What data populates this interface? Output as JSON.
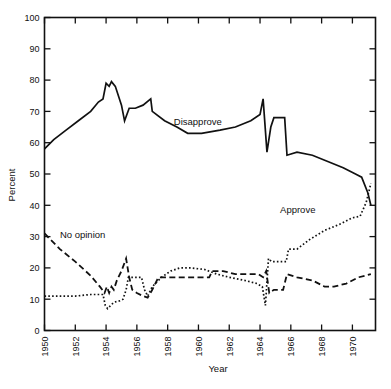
{
  "chart_data": {
    "type": "line",
    "title": "",
    "xlabel": "Year",
    "ylabel": "Percent",
    "xlim": [
      1950,
      1971.5
    ],
    "ylim": [
      0,
      100
    ],
    "grid": false,
    "legend_position": "inline-annotations",
    "x_ticks": [
      1950,
      1952,
      1954,
      1956,
      1958,
      1960,
      1962,
      1964,
      1966,
      1968,
      1970
    ],
    "x_tick_labels": [
      "1950",
      "1952",
      "1954",
      "1956",
      "1958",
      "1960",
      "1962",
      "1964",
      "1966",
      "1968",
      "1970"
    ],
    "y_ticks": [
      0,
      10,
      20,
      30,
      40,
      50,
      60,
      70,
      80,
      90,
      100
    ],
    "y_tick_labels": [
      "0",
      "10",
      "20",
      "30",
      "40",
      "50",
      "60",
      "70",
      "80",
      "90",
      "100"
    ],
    "series": [
      {
        "name": "Disapprove",
        "style": "solid",
        "label_x": 1958.4,
        "label_y": 65.5,
        "points": [
          [
            1950.0,
            58
          ],
          [
            1950.6,
            61
          ],
          [
            1951.4,
            64
          ],
          [
            1952.2,
            67
          ],
          [
            1953.0,
            70
          ],
          [
            1953.5,
            73
          ],
          [
            1953.8,
            74
          ],
          [
            1954.0,
            79
          ],
          [
            1954.2,
            78
          ],
          [
            1954.35,
            79.5
          ],
          [
            1954.6,
            78
          ],
          [
            1955.0,
            72
          ],
          [
            1955.2,
            67
          ],
          [
            1955.5,
            71
          ],
          [
            1955.9,
            71
          ],
          [
            1956.4,
            72
          ],
          [
            1956.9,
            74
          ],
          [
            1957.0,
            70
          ],
          [
            1957.8,
            67
          ],
          [
            1958.6,
            65
          ],
          [
            1959.3,
            63
          ],
          [
            1960.2,
            63
          ],
          [
            1961.4,
            64
          ],
          [
            1962.4,
            65
          ],
          [
            1963.4,
            67
          ],
          [
            1964.0,
            69
          ],
          [
            1964.2,
            74
          ],
          [
            1964.45,
            57
          ],
          [
            1964.7,
            65
          ],
          [
            1964.9,
            68
          ],
          [
            1965.6,
            68
          ],
          [
            1965.75,
            56
          ],
          [
            1966.4,
            57
          ],
          [
            1967.4,
            56
          ],
          [
            1968.4,
            54
          ],
          [
            1969.4,
            52
          ],
          [
            1970.2,
            50
          ],
          [
            1970.6,
            49
          ],
          [
            1971.0,
            44
          ],
          [
            1971.2,
            40
          ]
        ]
      },
      {
        "name": "Approve",
        "style": "dotted",
        "label_x": 1965.3,
        "label_y": 37.5,
        "points": [
          [
            1950.0,
            11
          ],
          [
            1951.0,
            11
          ],
          [
            1952.0,
            11
          ],
          [
            1953.0,
            11.5
          ],
          [
            1953.5,
            11.5
          ],
          [
            1953.8,
            11.5
          ],
          [
            1953.95,
            8
          ],
          [
            1954.1,
            7
          ],
          [
            1954.5,
            9
          ],
          [
            1954.9,
            9.5
          ],
          [
            1955.1,
            10
          ],
          [
            1955.3,
            13
          ],
          [
            1955.45,
            17
          ],
          [
            1955.9,
            17
          ],
          [
            1956.3,
            17
          ],
          [
            1956.5,
            13
          ],
          [
            1956.7,
            11
          ],
          [
            1957.0,
            14
          ],
          [
            1957.6,
            17
          ],
          [
            1958.2,
            19
          ],
          [
            1958.8,
            20
          ],
          [
            1959.5,
            20
          ],
          [
            1960.4,
            19.5
          ],
          [
            1961.2,
            18
          ],
          [
            1962.0,
            17
          ],
          [
            1963.0,
            16
          ],
          [
            1963.8,
            15
          ],
          [
            1964.15,
            14
          ],
          [
            1964.35,
            8
          ],
          [
            1964.55,
            23
          ],
          [
            1964.75,
            22
          ],
          [
            1965.2,
            22
          ],
          [
            1965.7,
            22
          ],
          [
            1965.85,
            26
          ],
          [
            1966.4,
            26
          ],
          [
            1967.2,
            29
          ],
          [
            1968.2,
            32
          ],
          [
            1969.2,
            34
          ],
          [
            1970.0,
            36
          ],
          [
            1970.5,
            36.5
          ],
          [
            1970.9,
            41
          ],
          [
            1971.2,
            47
          ]
        ]
      },
      {
        "name": "No opinion",
        "style": "dashed",
        "label_x": 1951.0,
        "label_y": 29.5,
        "points": [
          [
            1950.0,
            31
          ],
          [
            1951.0,
            26
          ],
          [
            1952.0,
            22
          ],
          [
            1953.0,
            17.5
          ],
          [
            1953.6,
            14
          ],
          [
            1953.9,
            12
          ],
          [
            1954.05,
            14
          ],
          [
            1954.2,
            12
          ],
          [
            1954.35,
            14
          ],
          [
            1954.5,
            13
          ],
          [
            1954.7,
            16
          ],
          [
            1955.0,
            19
          ],
          [
            1955.3,
            23
          ],
          [
            1955.5,
            17
          ],
          [
            1955.7,
            13
          ],
          [
            1956.0,
            12
          ],
          [
            1956.4,
            11
          ],
          [
            1956.7,
            10.5
          ],
          [
            1957.0,
            13
          ],
          [
            1957.4,
            17
          ],
          [
            1958.0,
            17
          ],
          [
            1959.0,
            17
          ],
          [
            1960.0,
            17
          ],
          [
            1960.7,
            17
          ],
          [
            1960.9,
            19
          ],
          [
            1961.6,
            19
          ],
          [
            1962.4,
            18
          ],
          [
            1963.2,
            18
          ],
          [
            1963.9,
            18
          ],
          [
            1964.2,
            17
          ],
          [
            1964.4,
            19
          ],
          [
            1964.6,
            12
          ],
          [
            1964.9,
            13
          ],
          [
            1965.2,
            13
          ],
          [
            1965.5,
            13
          ],
          [
            1965.75,
            18
          ],
          [
            1966.4,
            17
          ],
          [
            1967.4,
            16
          ],
          [
            1968.2,
            14
          ],
          [
            1968.8,
            14
          ],
          [
            1969.6,
            15
          ],
          [
            1970.4,
            17
          ],
          [
            1971.2,
            18
          ]
        ]
      }
    ]
  }
}
